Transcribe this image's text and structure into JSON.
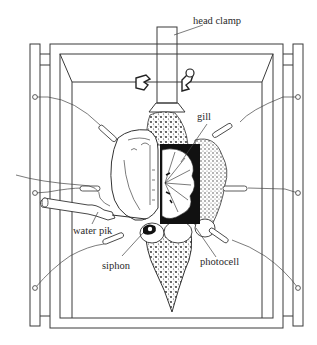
{
  "diagram": {
    "labels": {
      "head_clamp": "head clamp",
      "gill": "gill",
      "water_pik": "water pik",
      "siphon": "siphon",
      "photocell": "photocell"
    },
    "colors": {
      "line": "#3a3a3a",
      "background": "#ffffff",
      "photocell_fill": "#111111",
      "stipple": "#555555"
    }
  }
}
